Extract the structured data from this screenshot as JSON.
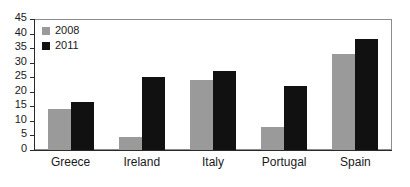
{
  "chart_data": {
    "type": "bar",
    "title": "",
    "subtitle": "",
    "xlabel": "",
    "ylabel": "",
    "categories": [
      "Greece",
      "Ireland",
      "Italy",
      "Portugal",
      "Spain"
    ],
    "series": [
      {
        "name": "2008",
        "color": "#9a9a9a",
        "values": [
          14,
          4.5,
          24,
          8,
          33
        ]
      },
      {
        "name": "2011",
        "color": "#111111",
        "values": [
          16.5,
          25,
          27,
          22,
          38
        ]
      }
    ],
    "ylim": [
      0,
      45
    ],
    "ytick_step": 5,
    "ytick_labels": [
      "0",
      "5",
      "10",
      "15",
      "20",
      "25",
      "30",
      "35",
      "40",
      "45"
    ],
    "ytick_values": [
      0,
      5,
      10,
      15,
      20,
      25,
      30,
      35,
      40,
      45
    ],
    "grid": false,
    "legend_position": "top-left",
    "legend_entries": [
      "2008",
      "2011"
    ],
    "frame": true,
    "annotations": []
  }
}
